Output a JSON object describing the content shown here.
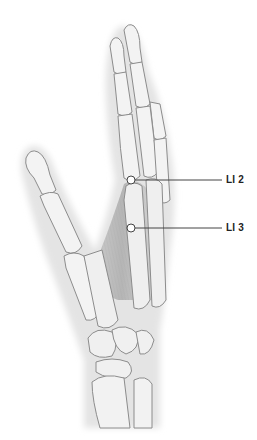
{
  "figure": {
    "colors": {
      "background": "#ffffff",
      "skin": "#e6e6e6",
      "bone_fill": "#f2f2f2",
      "bone_outline": "#8a8a8a",
      "muscle": "#bdbdbd",
      "leader_line": "#444444",
      "point_fill": "#ffffff",
      "point_stroke": "#444444"
    }
  },
  "points": [
    {
      "label": "LI 2",
      "x": 131,
      "y": 180,
      "label_x": 226
    },
    {
      "label": "LI 3",
      "x": 131,
      "y": 228,
      "label_x": 226
    }
  ]
}
